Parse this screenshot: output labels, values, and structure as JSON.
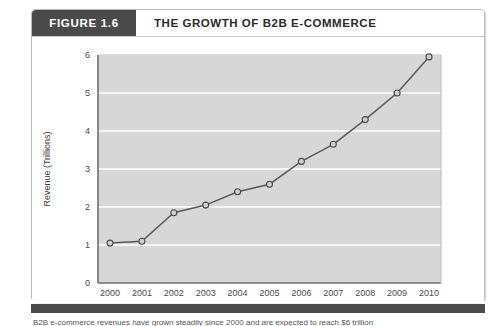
{
  "figure": {
    "number_label": "FIGURE 1.6",
    "title": "THE GROWTH OF B2B E-COMMERCE",
    "caption_partial": "B2B e-commerce revenues have grown steadily since 2000 and are expected to reach $6 trillion"
  },
  "colors": {
    "header_box": "#4a4a4a",
    "title_text": "#2b2b2b",
    "plot_background": "#d7d7d7",
    "gridline": "#ffffff",
    "line_series": "#5a5a5a",
    "marker_fill": "#d0d0d0",
    "marker_stroke": "#4a4a4a",
    "frame_border": "#b9b9b9",
    "axis": "#6e6e6e"
  },
  "chart_data": {
    "type": "line",
    "title": "THE GROWTH OF B2B E-COMMERCE",
    "xlabel": "Year",
    "ylabel": "Revenue (Trillions)",
    "categories": [
      "2000",
      "2001",
      "2002",
      "2003",
      "2004",
      "2005",
      "2006",
      "2007",
      "2008",
      "2009",
      "2010"
    ],
    "values": [
      1.05,
      1.1,
      1.85,
      2.05,
      2.4,
      2.6,
      3.2,
      3.65,
      4.3,
      5.0,
      5.95
    ],
    "ylim": [
      0,
      6
    ],
    "yticks": [
      0,
      1,
      2,
      3,
      4,
      5,
      6
    ],
    "ytick_labels": [
      "0",
      "1",
      "2",
      "3",
      "4",
      "5",
      "6"
    ],
    "xtick_labels": [
      "2000",
      "2001",
      "2002",
      "2003",
      "2004",
      "2005",
      "2006",
      "2007",
      "2008",
      "2009",
      "2010"
    ],
    "grid": true,
    "grid_axis": "y",
    "legend": "none",
    "markers": "circle"
  }
}
